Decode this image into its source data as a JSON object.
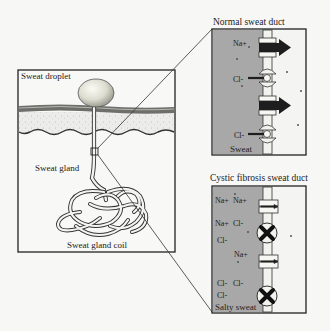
{
  "overview": {
    "labels": {
      "droplet": "Sweat droplet",
      "gland": "Sweat gland",
      "coil": "Sweat gland coil"
    }
  },
  "normal_duct": {
    "title": "Normal sweat duct",
    "ions": [
      "Na+",
      "Cl-",
      "Cl-"
    ],
    "sweat_label": "Sweat"
  },
  "cf_duct": {
    "title": "Cystic fibrosis sweat duct",
    "ions": {
      "na1": "Na+",
      "na2": "Na+",
      "na3": "Na+",
      "na4": "Na+",
      "cl1": "Cl-",
      "cl2": "Cl-",
      "cl3": "Cl-",
      "cl4": "Cl-",
      "cl5": "Cl-"
    },
    "sweat_label": "Salty sweat"
  },
  "colors": {
    "lumen_gray": "#a8a8a8",
    "outline": "#222222",
    "background": "#f7f7f5",
    "droplet": "#e6e6dc"
  }
}
